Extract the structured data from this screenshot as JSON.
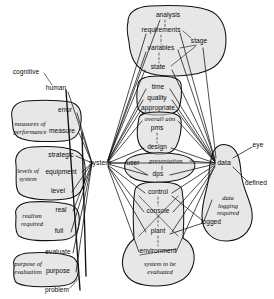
{
  "diagram": {
    "style": "hand-drawn shaded blobs with radiating link lines",
    "hubs": [
      "system",
      "data"
    ],
    "colors": {
      "blob_fill": "#d9d9d9",
      "ink": "#111111",
      "background": "#ffffff"
    },
    "nodes": [
      {
        "id": "cognitive",
        "label": "cognitive",
        "x": 26,
        "y": 72,
        "kind": "leaf"
      },
      {
        "id": "human",
        "label": "human",
        "x": 56,
        "y": 88,
        "kind": "leaf"
      },
      {
        "id": "error",
        "label": "error",
        "x": 65,
        "y": 110,
        "kind": "leaf"
      },
      {
        "id": "measure",
        "label": "measure",
        "x": 62,
        "y": 131,
        "kind": "leaf"
      },
      {
        "id": "strategic",
        "label": "strategic",
        "x": 61,
        "y": 155,
        "kind": "leaf"
      },
      {
        "id": "equipment",
        "label": "equipment",
        "x": 61,
        "y": 172,
        "kind": "leaf"
      },
      {
        "id": "level",
        "label": "level",
        "x": 58,
        "y": 191,
        "kind": "leaf"
      },
      {
        "id": "real",
        "label": "real",
        "x": 61,
        "y": 210,
        "kind": "leaf"
      },
      {
        "id": "full",
        "label": "full",
        "x": 59,
        "y": 231,
        "kind": "leaf"
      },
      {
        "id": "evaluate",
        "label": "evaluate",
        "x": 58,
        "y": 252,
        "kind": "leaf"
      },
      {
        "id": "purpose",
        "label": "purpose",
        "x": 58,
        "y": 271,
        "kind": "leaf"
      },
      {
        "id": "problem",
        "label": "problem",
        "x": 57,
        "y": 290,
        "kind": "leaf"
      },
      {
        "id": "system",
        "label": "system",
        "x": 100,
        "y": 163,
        "kind": "hub"
      },
      {
        "id": "analysis",
        "label": "analysis",
        "x": 168,
        "y": 15,
        "kind": "leaf"
      },
      {
        "id": "requirements",
        "label": "requirements",
        "x": 161,
        "y": 30,
        "kind": "leaf"
      },
      {
        "id": "stage",
        "label": "stage",
        "x": 199,
        "y": 41,
        "kind": "leaf"
      },
      {
        "id": "variables",
        "label": "variables",
        "x": 161,
        "y": 48,
        "kind": "leaf"
      },
      {
        "id": "state",
        "label": "state",
        "x": 158,
        "y": 67,
        "kind": "leaf"
      },
      {
        "id": "time",
        "label": "time",
        "x": 158,
        "y": 87,
        "kind": "leaf"
      },
      {
        "id": "quality",
        "label": "quality",
        "x": 157,
        "y": 98,
        "kind": "leaf"
      },
      {
        "id": "appropriate",
        "label": "appropriate",
        "x": 158,
        "y": 108,
        "kind": "leaf"
      },
      {
        "id": "overall-aim",
        "label": "overall aim",
        "x": 160,
        "y": 119,
        "kind": "leaf-italic"
      },
      {
        "id": "pms",
        "label": "pms",
        "x": 157,
        "y": 128,
        "kind": "leaf"
      },
      {
        "id": "design",
        "label": "design",
        "x": 157,
        "y": 147,
        "kind": "leaf"
      },
      {
        "id": "user",
        "label": "user",
        "x": 133,
        "y": 163,
        "kind": "leaf"
      },
      {
        "id": "presentation",
        "label": "presentation",
        "x": 166,
        "y": 161,
        "kind": "leaf-italic"
      },
      {
        "id": "dps",
        "label": "dps",
        "x": 158,
        "y": 174,
        "kind": "leaf"
      },
      {
        "id": "control",
        "label": "control",
        "x": 158,
        "y": 192,
        "kind": "leaf"
      },
      {
        "id": "console",
        "label": "console",
        "x": 158,
        "y": 211,
        "kind": "leaf"
      },
      {
        "id": "plant",
        "label": "plant",
        "x": 158,
        "y": 231,
        "kind": "leaf"
      },
      {
        "id": "environment",
        "label": "environment",
        "x": 158,
        "y": 251,
        "kind": "leaf"
      },
      {
        "id": "logged",
        "label": "logged",
        "x": 211,
        "y": 222,
        "kind": "leaf"
      },
      {
        "id": "data",
        "label": "data",
        "x": 224,
        "y": 163,
        "kind": "hub"
      },
      {
        "id": "eye",
        "label": "eye",
        "x": 258,
        "y": 145,
        "kind": "leaf"
      },
      {
        "id": "defined",
        "label": "defined",
        "x": 256,
        "y": 183,
        "kind": "leaf"
      }
    ],
    "group_labels": [
      {
        "id": "measures-of-performance",
        "label": "measures of\nperformance",
        "x": 30,
        "y": 128
      },
      {
        "id": "levels-of-system",
        "label": "levels of\nsystem",
        "x": 28,
        "y": 175
      },
      {
        "id": "realism-required",
        "label": "realism\nrequired",
        "x": 32,
        "y": 220
      },
      {
        "id": "purpose-of-evaluation",
        "label": "purpose of\nevaluation",
        "x": 28,
        "y": 268
      },
      {
        "id": "system-to-be-evaluated",
        "label": "system to be\nevaluated",
        "x": 160,
        "y": 268
      },
      {
        "id": "data-logging-required",
        "label": "data\nlogging\nrequired",
        "x": 228,
        "y": 205
      }
    ]
  }
}
